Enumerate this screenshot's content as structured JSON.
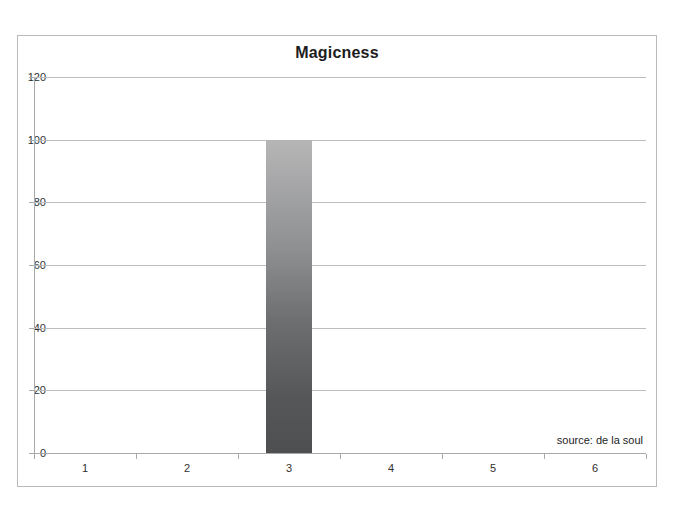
{
  "chart_data": {
    "type": "bar",
    "title": "Magicness",
    "xlabel": "",
    "ylabel": "",
    "categories": [
      "1",
      "2",
      "3",
      "4",
      "5",
      "6"
    ],
    "values": [
      0,
      0,
      100,
      0,
      0,
      0
    ],
    "ylim": [
      0,
      120
    ],
    "ytick_labels": [
      "0",
      "20",
      "40",
      "60",
      "80",
      "100",
      "120"
    ],
    "ytick_values": [
      0,
      20,
      40,
      60,
      80,
      100,
      120
    ],
    "grid": "horizontal",
    "legend": "none",
    "annotations": [
      {
        "name": "source-note",
        "text": "source: de la soul",
        "position": "bottom-right"
      }
    ],
    "series": [
      {
        "name": "Magicness",
        "values": [
          0,
          0,
          100,
          0,
          0,
          0
        ]
      }
    ],
    "style": {
      "bar_gradient_top": "#b6b6b7",
      "bar_gradient_bottom": "#4e4f51",
      "gridline_color": "#bcbcbc",
      "axis_color": "#a9a9a9",
      "frame_color": "#b9b9b9",
      "title_color": "#1d1d1d",
      "background": "#ffffff"
    }
  }
}
